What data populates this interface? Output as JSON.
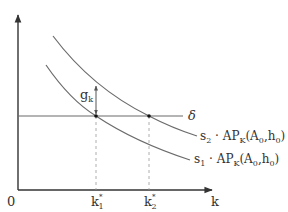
{
  "colors": {
    "axis": "#333333",
    "curve": "#6b6b6b",
    "horizontal_line": "#6b6b6b",
    "dashed": "#9a9a9a",
    "point": "#111111",
    "text": "#333333"
  },
  "axes": {
    "origin_label": "0",
    "x_label": "k"
  },
  "horizontal_line": {
    "label": "δ"
  },
  "curves": [
    {
      "name": "s2",
      "label_s": "s",
      "label_s_sub": "2",
      "label_rest": " · AP",
      "label_ap_sub": "K",
      "label_args": "(A",
      "label_a_sub": "0",
      "label_comma": ",h",
      "label_h_sub": "0",
      "label_close": ")"
    },
    {
      "name": "s1",
      "label_s": "s",
      "label_s_sub": "1",
      "label_rest": " · AP",
      "label_ap_sub": "K",
      "label_args": "(A",
      "label_a_sub": "0",
      "label_comma": ",h",
      "label_h_sub": "0",
      "label_close": ")"
    }
  ],
  "equilibria": [
    {
      "name": "k1*",
      "label": "k",
      "sub": "1",
      "sup": "*"
    },
    {
      "name": "k2*",
      "label": "k",
      "sub": "2",
      "sup": "*"
    }
  ],
  "gap": {
    "label": "g",
    "sub": "k"
  }
}
